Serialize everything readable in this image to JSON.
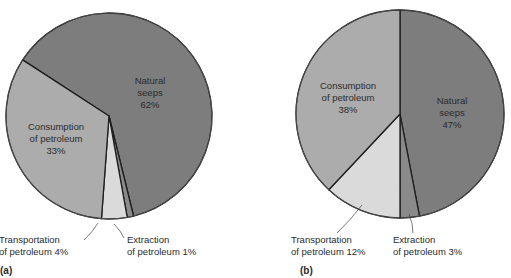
{
  "colors": {
    "natural_seeps": "#7d7d7d",
    "consumption": "#acacac",
    "transportation": "#dadada",
    "extraction": "#8a8a8a",
    "outline": "#1e1e1e"
  },
  "chart_data": [
    {
      "type": "pie",
      "panel_label": "(a)",
      "slices": [
        {
          "key": "natural_seeps",
          "label_lines": [
            "Natural",
            "seeps",
            "62%"
          ],
          "value": 62
        },
        {
          "key": "extraction",
          "label_lines": [
            "Extraction",
            "of petroleum 1%"
          ],
          "value": 1
        },
        {
          "key": "transportation",
          "label_lines": [
            "Transportation",
            "of petroleum 4%"
          ],
          "value": 4
        },
        {
          "key": "consumption",
          "label_lines": [
            "Consumption",
            "of petroleum",
            "33%"
          ],
          "value": 33
        }
      ],
      "direction": "clockwise"
    },
    {
      "type": "pie",
      "panel_label": "(b)",
      "slices": [
        {
          "key": "natural_seeps",
          "label_lines": [
            "Natural",
            "seeps",
            "47%"
          ],
          "value": 47
        },
        {
          "key": "extraction",
          "label_lines": [
            "Extraction",
            "of petroleum 3%"
          ],
          "value": 3
        },
        {
          "key": "transportation",
          "label_lines": [
            "Transportation",
            "of petroleum 12%"
          ],
          "value": 12
        },
        {
          "key": "consumption",
          "label_lines": [
            "Consumption",
            "of petroleum",
            "38%"
          ],
          "value": 38
        }
      ],
      "direction": "clockwise"
    }
  ]
}
